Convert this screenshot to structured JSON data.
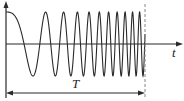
{
  "diagram": {
    "labels": {
      "time_axis": "t",
      "duration": "T"
    },
    "colors": {
      "stroke": "#2a2a2a",
      "dashed": "#888888"
    }
  }
}
